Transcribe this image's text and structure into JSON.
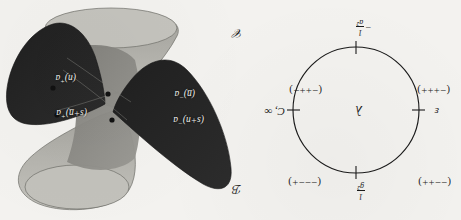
{
  "figure": {
    "orientation_note": "upside-down scan"
  },
  "circle_diagram": {
    "center_symbol": "λ",
    "top_label": {
      "text": "1/g²",
      "numerator": "1",
      "denominator": "g²"
    },
    "bottom_label": {
      "text": "−1/a²",
      "sign": "−",
      "numerator": "1",
      "denominator": "a²"
    },
    "left_label": "ε",
    "right_label": "C, ∞",
    "signatures": [
      {
        "position": "upper-left",
        "text": "(−−++)"
      },
      {
        "position": "upper-right",
        "text": "(−−−+)"
      },
      {
        "position": "lower-left",
        "text": "(−+++)"
      },
      {
        "position": "lower-right",
        "text": "(−++−)"
      }
    ],
    "tick_count": 4
  },
  "cone_diagram": {
    "corner_labels": [
      {
        "name": "B",
        "text": "ℬ"
      },
      {
        "name": "C",
        "text": "𝒞"
      }
    ],
    "point_labels": [
      {
        "id": "a-minus-u-plus-s",
        "text": "a⁻(u+s)",
        "base": "a",
        "sup": "−",
        "arg": "(s+n)"
      },
      {
        "id": "a-minus-u",
        "text": "a⁻(u̲)",
        "base": "a",
        "sup": "−",
        "arg": "(n̲)"
      },
      {
        "id": "a-plus-u-plus-s",
        "text": "a⁺(u̲+s)",
        "base": "a",
        "sup": "+",
        "arg": "(s+n̲)"
      },
      {
        "id": "a-plus-u",
        "text": "a⁺(u)",
        "base": "a",
        "sup": "+",
        "arg": "(n)"
      }
    ],
    "marked_points": 4
  },
  "colors": {
    "paper": "#f3f2ef",
    "ink": "#1b1b1b",
    "cone_dark": "#272727",
    "cone_light": "#b9b8b3",
    "cone_mid": "#8e8d88",
    "label_text": "#f2f1ee"
  }
}
